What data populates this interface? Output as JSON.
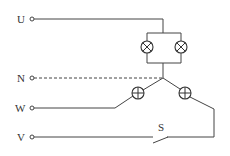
{
  "diagram": {
    "type": "circuit",
    "terminals": [
      {
        "id": "U",
        "label": "U"
      },
      {
        "id": "N",
        "label": "N"
      },
      {
        "id": "W",
        "label": "W"
      },
      {
        "id": "V",
        "label": "V"
      }
    ],
    "components": {
      "top_lamp_left": {
        "symbol": "lamp-x-icon"
      },
      "top_lamp_right": {
        "symbol": "lamp-x-icon"
      },
      "wye_lamp_left": {
        "symbol": "lamp-plus-icon"
      },
      "wye_lamp_right": {
        "symbol": "lamp-plus-icon"
      },
      "switch": {
        "label": "S",
        "state": "open"
      }
    },
    "colors": {
      "wire": "#444444",
      "background": "#ffffff"
    }
  }
}
